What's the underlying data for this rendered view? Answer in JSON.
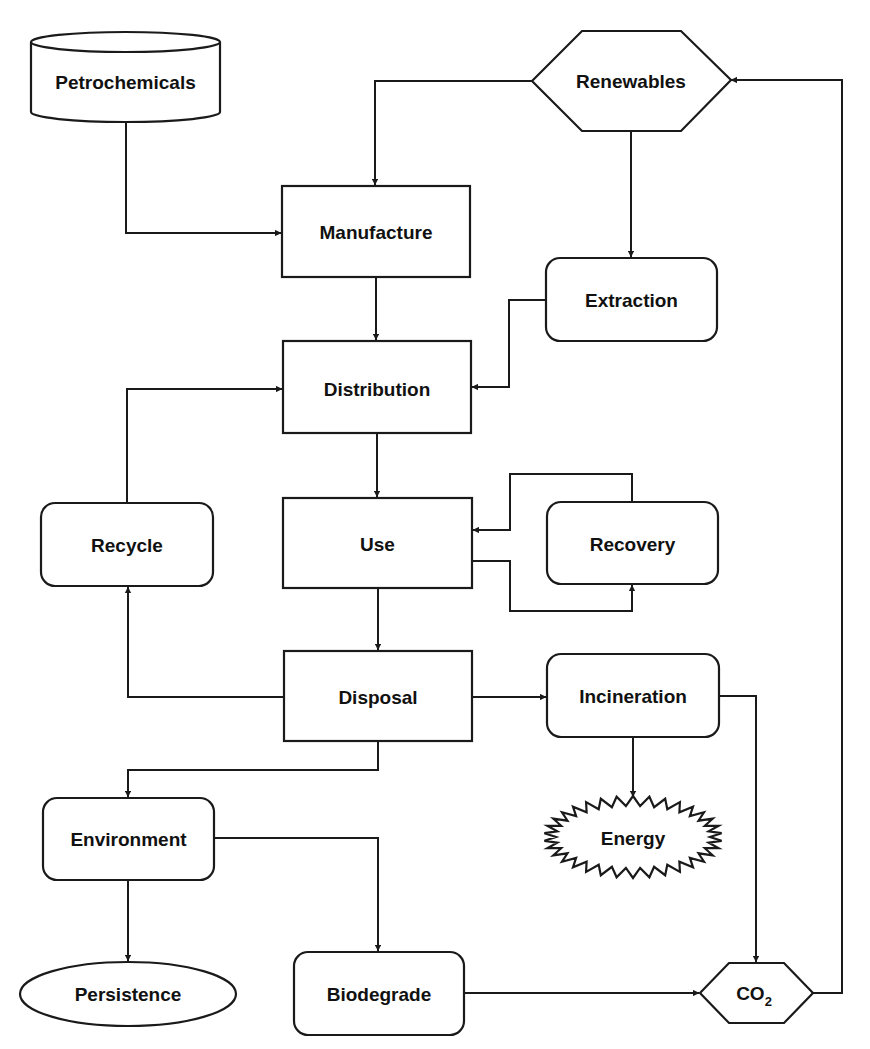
{
  "diagram": {
    "type": "flowchart",
    "colors": {
      "stroke": "#1a1a1a",
      "fill": "#ffffff",
      "text": "#111111"
    },
    "nodes": {
      "petrochemicals": {
        "label": "Petrochemicals",
        "shape": "cylinder"
      },
      "renewables": {
        "label": "Renewables",
        "shape": "hexagon"
      },
      "manufacture": {
        "label": "Manufacture",
        "shape": "rectangle"
      },
      "extraction": {
        "label": "Extraction",
        "shape": "rounded-rectangle"
      },
      "distribution": {
        "label": "Distribution",
        "shape": "rectangle"
      },
      "recycle": {
        "label": "Recycle",
        "shape": "rounded-rectangle"
      },
      "use": {
        "label": "Use",
        "shape": "rectangle"
      },
      "recovery": {
        "label": "Recovery",
        "shape": "rounded-rectangle"
      },
      "disposal": {
        "label": "Disposal",
        "shape": "rectangle"
      },
      "incineration": {
        "label": "Incineration",
        "shape": "rounded-rectangle"
      },
      "energy": {
        "label": "Energy",
        "shape": "starburst"
      },
      "environment": {
        "label": "Environment",
        "shape": "rounded-rectangle"
      },
      "persistence": {
        "label": "Persistence",
        "shape": "ellipse"
      },
      "biodegrade": {
        "label": "Biodegrade",
        "shape": "rounded-rectangle"
      },
      "co2": {
        "label": "CO",
        "subscript": "2",
        "shape": "hexagon"
      }
    },
    "edges": [
      {
        "from": "Petrochemicals",
        "to": "Manufacture"
      },
      {
        "from": "Renewables",
        "to": "Manufacture"
      },
      {
        "from": "Renewables",
        "to": "Extraction"
      },
      {
        "from": "Manufacture",
        "to": "Distribution"
      },
      {
        "from": "Extraction",
        "to": "Distribution"
      },
      {
        "from": "Recycle",
        "to": "Distribution"
      },
      {
        "from": "Distribution",
        "to": "Use"
      },
      {
        "from": "Recovery",
        "to": "Use"
      },
      {
        "from": "Use",
        "to": "Recovery"
      },
      {
        "from": "Use",
        "to": "Disposal"
      },
      {
        "from": "Disposal",
        "to": "Recycle"
      },
      {
        "from": "Disposal",
        "to": "Incineration"
      },
      {
        "from": "Disposal",
        "to": "Environment"
      },
      {
        "from": "Incineration",
        "to": "Energy"
      },
      {
        "from": "Incineration",
        "to": "CO2"
      },
      {
        "from": "Environment",
        "to": "Persistence"
      },
      {
        "from": "Environment",
        "to": "Biodegrade"
      },
      {
        "from": "Biodegrade",
        "to": "CO2"
      },
      {
        "from": "CO2",
        "to": "Renewables"
      }
    ]
  }
}
